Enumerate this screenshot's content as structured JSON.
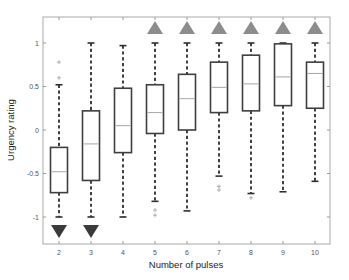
{
  "chart_data": {
    "type": "boxplot",
    "title": "",
    "xlabel": "Number of pulses",
    "ylabel": "Urgency rating",
    "ylim": [
      -1.3,
      1.3
    ],
    "yticks": [
      -1,
      -0.5,
      0,
      0.5,
      1
    ],
    "ytick_labels": [
      "-1",
      "-0.5",
      "0",
      "0.5",
      "1"
    ],
    "categories": [
      "2",
      "3",
      "4",
      "5",
      "6",
      "7",
      "8",
      "9",
      "10"
    ],
    "grid": false,
    "legend": null,
    "boxes": [
      {
        "x": "2",
        "whisker_high": 0.52,
        "q3": -0.2,
        "median": -0.48,
        "q1": -0.72,
        "whisker_low": -1.0,
        "outliers": [
          0.6,
          0.78
        ],
        "marker": "down"
      },
      {
        "x": "3",
        "whisker_high": 1.0,
        "q3": 0.22,
        "median": -0.16,
        "q1": -0.58,
        "whisker_low": -1.0,
        "outliers": [],
        "marker": "down"
      },
      {
        "x": "4",
        "whisker_high": 0.97,
        "q3": 0.48,
        "median": 0.05,
        "q1": -0.26,
        "whisker_low": -1.0,
        "outliers": [],
        "marker": "none"
      },
      {
        "x": "5",
        "whisker_high": 1.0,
        "q3": 0.52,
        "median": 0.2,
        "q1": -0.04,
        "whisker_low": -0.82,
        "outliers": [
          -0.92,
          -0.98
        ],
        "marker": "up"
      },
      {
        "x": "6",
        "whisker_high": 1.0,
        "q3": 0.64,
        "median": 0.36,
        "q1": 0.0,
        "whisker_low": -0.93,
        "outliers": [],
        "marker": "up"
      },
      {
        "x": "7",
        "whisker_high": 1.0,
        "q3": 0.78,
        "median": 0.49,
        "q1": 0.2,
        "whisker_low": -0.53,
        "outliers": [
          -0.65,
          -0.69
        ],
        "marker": "up"
      },
      {
        "x": "8",
        "whisker_high": 1.0,
        "q3": 0.86,
        "median": 0.53,
        "q1": 0.22,
        "whisker_low": -0.73,
        "outliers": [
          -0.78
        ],
        "marker": "up"
      },
      {
        "x": "9",
        "whisker_high": 1.0,
        "q3": 0.99,
        "median": 0.61,
        "q1": 0.28,
        "whisker_low": -0.71,
        "outliers": [],
        "marker": "up"
      },
      {
        "x": "10",
        "whisker_high": 1.0,
        "q3": 0.78,
        "median": 0.65,
        "q1": 0.25,
        "whisker_low": -0.59,
        "outliers": [],
        "marker": "up"
      }
    ],
    "colors": {
      "box_edge": "#3f3f3f",
      "median": "#a6a6a6",
      "whisker": "#2e2e2e",
      "outlier": "#a8a8a8",
      "marker_up": "#8c8c8c",
      "marker_down": "#3a3a3a",
      "frame": "#a9a9a9"
    }
  }
}
